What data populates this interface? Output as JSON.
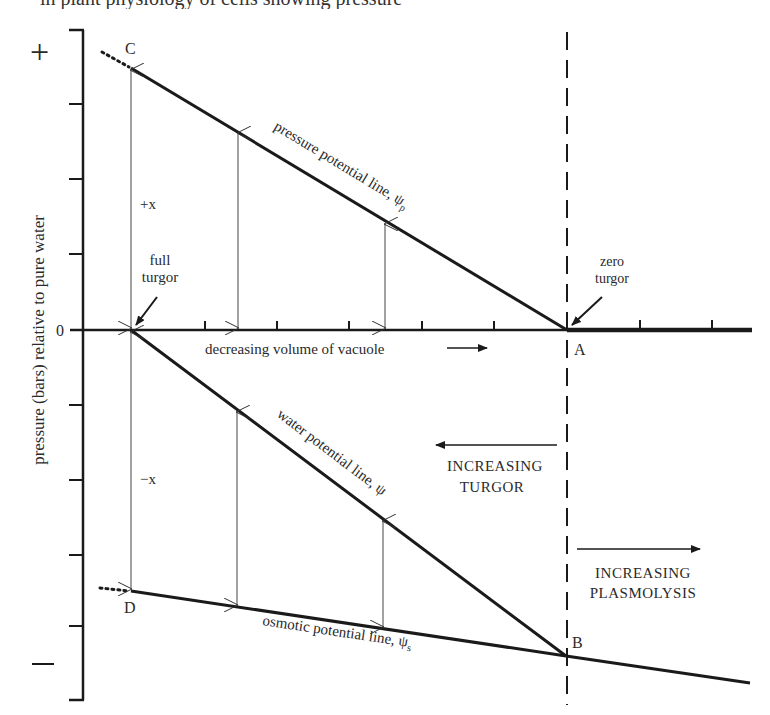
{
  "header_fragment": "in plant physiology of cells showing pressure",
  "axis": {
    "y_label": "pressure (bars) relative to pure water",
    "plus_sign": "+",
    "minus_sign": "−",
    "zero_label": "0",
    "x_label": "decreasing volume of vacuole"
  },
  "points": {
    "C": "C",
    "D": "D",
    "A": "A",
    "B": "B"
  },
  "lines": {
    "pressure": "pressure potential line, ψ",
    "pressure_sub": "p",
    "water": "water potential line, ψ",
    "osmotic": "osmotic potential line, ψ",
    "osmotic_sub": "s"
  },
  "annotations": {
    "full_turgor_1": "full",
    "full_turgor_2": "turgor",
    "zero_turgor_1": "zero",
    "zero_turgor_2": "turgor",
    "plus_x": "+x",
    "minus_x": "−x",
    "increasing_turgor_1": "INCREASING",
    "increasing_turgor_2": "TURGOR",
    "increasing_plasmolysis_1": "INCREASING",
    "increasing_plasmolysis_2": "PLASMOLYSIS"
  },
  "colors": {
    "ink": "#1a1a1a",
    "text": "#2a2a2a"
  }
}
